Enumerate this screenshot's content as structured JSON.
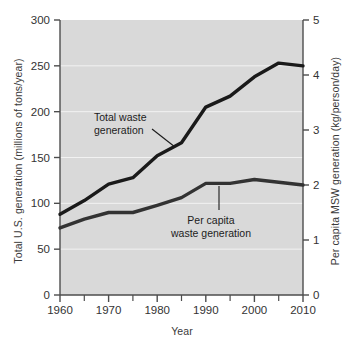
{
  "chart_data": {
    "type": "line",
    "title": "",
    "subtitle": "",
    "xlabel": "Year",
    "ylabel": "Total U.S. generation (millions of tons/year)",
    "y2label": "Per capita MSW generation (kg/person/day)",
    "xlim": [
      1960,
      2010
    ],
    "ylim": [
      0,
      300
    ],
    "y2lim": [
      0,
      5
    ],
    "xticks": [
      1960,
      1970,
      1980,
      1990,
      2000,
      2010
    ],
    "xticklabels": [
      "1960",
      "1970",
      "1980",
      "1990",
      "2000",
      "2010"
    ],
    "xminorticks": [
      1965,
      1975,
      1985,
      1995,
      2005
    ],
    "yticks": [
      0,
      50,
      100,
      150,
      200,
      250,
      300
    ],
    "yticklabels": [
      "0",
      "50",
      "100",
      "150",
      "200",
      "250",
      "300"
    ],
    "y2ticks": [
      0,
      1,
      2,
      3,
      4,
      5
    ],
    "y2ticklabels": [
      "0",
      "1",
      "2",
      "3",
      "4",
      "5"
    ],
    "grid": true,
    "grid_color": "#ffffff",
    "plot_bgcolor": "#d9d9d9",
    "line_color": "#1a1a1a",
    "legend": "inline-annotations",
    "series": [
      {
        "name": "Total waste generation",
        "axis": "left",
        "units": "millions of tons/year",
        "x": [
          1960,
          1965,
          1970,
          1975,
          1980,
          1985,
          1990,
          1995,
          2000,
          2005,
          2010
        ],
        "values": [
          88,
          103,
          121,
          128,
          152,
          166,
          205,
          217,
          238,
          253,
          250
        ]
      },
      {
        "name": "Per capita waste generation",
        "axis": "right",
        "units": "kg/person/day",
        "x": [
          1960,
          1965,
          1970,
          1975,
          1980,
          1985,
          1990,
          1995,
          2000,
          2005,
          2010
        ],
        "values": [
          1.22,
          1.38,
          1.5,
          1.5,
          1.63,
          1.77,
          2.03,
          2.03,
          2.1,
          2.05,
          2.0
        ]
      }
    ],
    "annotations": [
      {
        "name": "total-waste-label",
        "text_lines": [
          "Total waste",
          "generation"
        ],
        "points_to_year": 1985
      },
      {
        "name": "per-capita-label",
        "text_lines": [
          "Per capita",
          "waste generation"
        ],
        "points_to_year": 1995
      }
    ]
  }
}
